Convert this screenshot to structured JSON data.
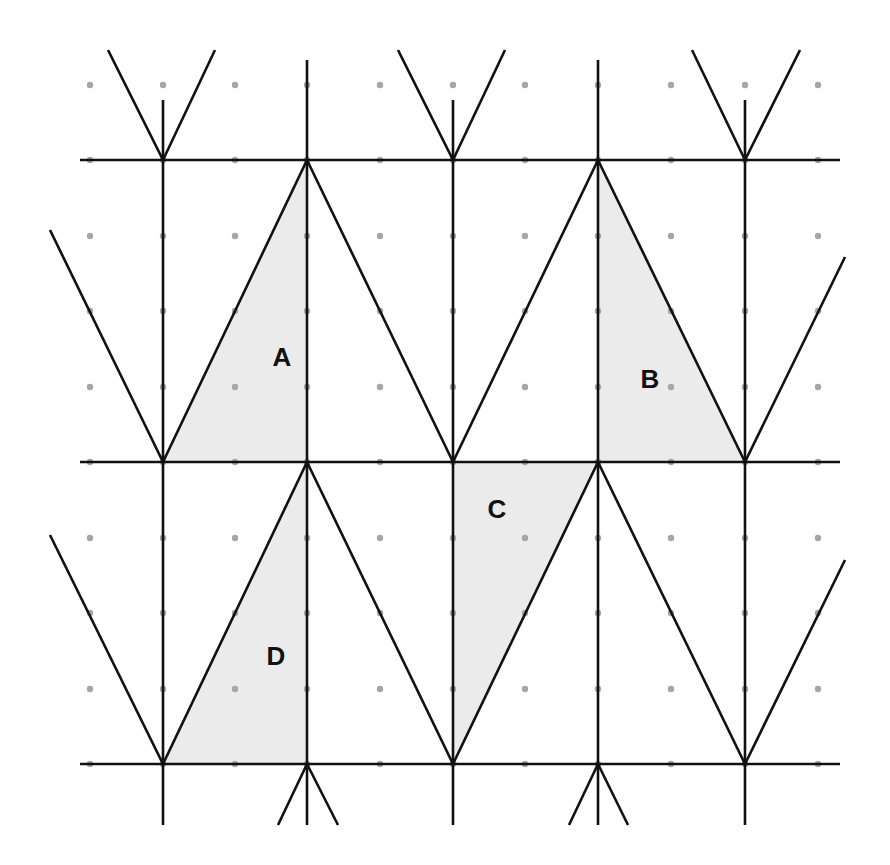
{
  "diagram": {
    "colors": {
      "background": "#ffffff",
      "shade": "#ebebeb",
      "line": "#111111",
      "dot": "#a6a6a6"
    },
    "grid": {
      "dot_x": [
        90,
        163,
        235,
        307,
        380,
        453,
        525,
        598,
        671,
        745,
        818
      ],
      "dot_y": [
        85,
        160,
        236,
        311,
        387,
        462,
        538,
        613,
        689,
        764
      ]
    },
    "shaded_regions": [
      {
        "label": "A",
        "points": [
          [
            163,
            462
          ],
          [
            307,
            160
          ],
          [
            307,
            462
          ]
        ],
        "label_pos": [
          282,
          366
        ]
      },
      {
        "label": "B",
        "points": [
          [
            598,
            160
          ],
          [
            598,
            462
          ],
          [
            745,
            462
          ]
        ],
        "label_pos": [
          650,
          388
        ]
      },
      {
        "label": "C",
        "points": [
          [
            453,
            462
          ],
          [
            598,
            462
          ],
          [
            453,
            764
          ]
        ],
        "label_pos": [
          497,
          518
        ]
      },
      {
        "label": "D",
        "points": [
          [
            163,
            764
          ],
          [
            307,
            462
          ],
          [
            307,
            764
          ]
        ],
        "label_pos": [
          276,
          665
        ]
      }
    ],
    "lines": [
      [
        80,
        160,
        840,
        160
      ],
      [
        80,
        462,
        840,
        462
      ],
      [
        80,
        764,
        840,
        764
      ],
      [
        163,
        100,
        163,
        825
      ],
      [
        307,
        60,
        307,
        825
      ],
      [
        453,
        100,
        453,
        825
      ],
      [
        598,
        60,
        598,
        825
      ],
      [
        745,
        100,
        745,
        825
      ],
      [
        108,
        50,
        163,
        160
      ],
      [
        163,
        160,
        215,
        50
      ],
      [
        398,
        50,
        453,
        160
      ],
      [
        453,
        160,
        505,
        50
      ],
      [
        692,
        50,
        745,
        160
      ],
      [
        745,
        160,
        800,
        50
      ],
      [
        50,
        230,
        163,
        462
      ],
      [
        163,
        462,
        307,
        160
      ],
      [
        307,
        160,
        453,
        462
      ],
      [
        453,
        462,
        598,
        160
      ],
      [
        598,
        160,
        745,
        462
      ],
      [
        745,
        462,
        845,
        257
      ],
      [
        50,
        535,
        163,
        764
      ],
      [
        163,
        764,
        307,
        462
      ],
      [
        307,
        462,
        453,
        764
      ],
      [
        453,
        764,
        598,
        462
      ],
      [
        598,
        462,
        745,
        764
      ],
      [
        745,
        764,
        845,
        560
      ],
      [
        278,
        825,
        307,
        764
      ],
      [
        307,
        764,
        338,
        825
      ],
      [
        569,
        825,
        598,
        764
      ],
      [
        598,
        764,
        628,
        825
      ]
    ],
    "labels": {
      "a": "A",
      "b": "B",
      "c": "C",
      "d": "D"
    }
  }
}
